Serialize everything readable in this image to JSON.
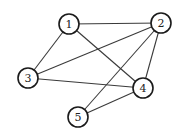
{
  "graph": {
    "node_radius": 10,
    "colors": {
      "edge": "#3a3a3a",
      "node_stroke": "#1a1a1a",
      "node_fill": "#ffffff",
      "label": "#222222"
    },
    "nodes": [
      {
        "id": "1",
        "label": "1",
        "x": 69,
        "y": 24
      },
      {
        "id": "2",
        "label": "2",
        "x": 161,
        "y": 23
      },
      {
        "id": "3",
        "label": "3",
        "x": 28,
        "y": 78
      },
      {
        "id": "4",
        "label": "4",
        "x": 143,
        "y": 88
      },
      {
        "id": "5",
        "label": "5",
        "x": 78,
        "y": 117
      }
    ],
    "edges": [
      [
        "1",
        "2"
      ],
      [
        "1",
        "3"
      ],
      [
        "1",
        "4"
      ],
      [
        "2",
        "3"
      ],
      [
        "2",
        "4"
      ],
      [
        "2",
        "5"
      ],
      [
        "3",
        "4"
      ],
      [
        "4",
        "5"
      ]
    ]
  }
}
